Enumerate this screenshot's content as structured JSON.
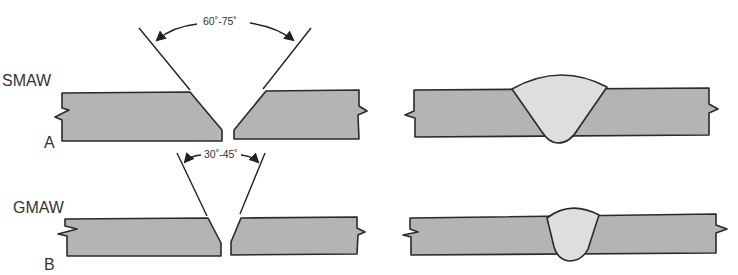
{
  "figure": {
    "rows": [
      {
        "id": "A",
        "process": "SMAW",
        "letter": "A",
        "groove_angle": "60˚-75˚",
        "before_label": "beveled plates",
        "after_label": "completed weld"
      },
      {
        "id": "B",
        "process": "GMAW",
        "letter": "B",
        "groove_angle": "30˚-45˚",
        "before_label": "beveled plates",
        "after_label": "completed weld"
      }
    ],
    "colors": {
      "plate_fill": "#b4b4b4",
      "weld_fill": "#dedede",
      "outline": "#2a2a2a",
      "background": "#ffffff"
    }
  }
}
